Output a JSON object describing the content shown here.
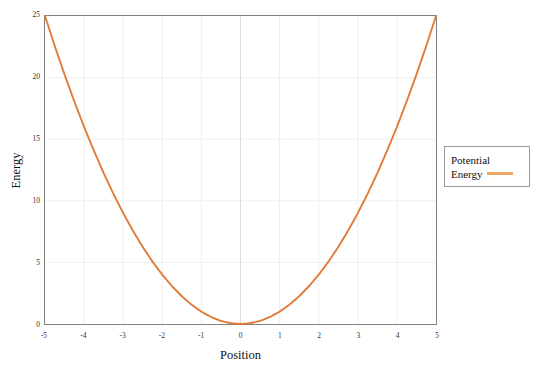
{
  "chart_data": {
    "type": "line",
    "title": "",
    "xlabel": "Position",
    "ylabel": "Energy",
    "xlim": [
      -5,
      5
    ],
    "ylim": [
      0,
      25
    ],
    "grid": true,
    "legend_position": "right-outside",
    "xticks": [
      -5,
      -4,
      -3,
      -2,
      -1,
      0,
      1,
      2,
      3,
      4,
      5
    ],
    "xtick_labels": [
      "-5",
      "-4",
      "-3",
      "-2",
      "-1",
      "0",
      "1",
      "2",
      "3",
      "4",
      "5"
    ],
    "yticks": [
      0,
      5,
      10,
      15,
      20,
      25
    ],
    "ytick_labels": [
      "0",
      "5",
      "10",
      "15",
      "20",
      "25"
    ],
    "series": [
      {
        "name": "Potential Energy",
        "color": "#e07b39",
        "legend_swatch_color": "#f0a868",
        "equation": "y = x^2",
        "x": [
          -5,
          -4.75,
          -4.5,
          -4.25,
          -4,
          -3.75,
          -3.5,
          -3.25,
          -3,
          -2.75,
          -2.5,
          -2.25,
          -2,
          -1.75,
          -1.5,
          -1.25,
          -1,
          -0.75,
          -0.5,
          -0.25,
          0,
          0.25,
          0.5,
          0.75,
          1,
          1.25,
          1.5,
          1.75,
          2,
          2.25,
          2.5,
          2.75,
          3,
          3.25,
          3.5,
          3.75,
          4,
          4.25,
          4.5,
          4.75,
          5
        ],
        "values": [
          25,
          22.5625,
          20.25,
          18.0625,
          16,
          14.0625,
          12.25,
          10.5625,
          9,
          7.5625,
          6.25,
          5.0625,
          4,
          3.0625,
          2.25,
          1.5625,
          1,
          0.5625,
          0.25,
          0.0625,
          0,
          0.0625,
          0.25,
          0.5625,
          1,
          1.5625,
          2.25,
          3.0625,
          4,
          5.0625,
          6.25,
          7.5625,
          9,
          10.5625,
          12.25,
          14.0625,
          16,
          18.0625,
          20.25,
          22.5625,
          25
        ]
      }
    ]
  },
  "legend": {
    "label_line1": "Potential",
    "label_line2": "Energy",
    "full_label": "Potential Energy"
  },
  "colors": {
    "curve": "#e07b39",
    "legend_swatch": "#f0a868",
    "axis": "#808080",
    "grid": "#efefef",
    "zero_line": "#dddddd",
    "text": "#111111",
    "background": "#ffffff"
  }
}
